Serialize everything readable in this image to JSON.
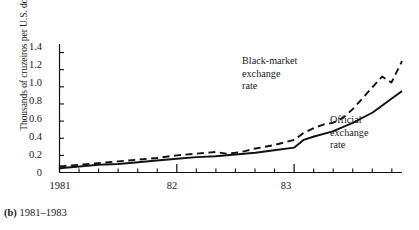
{
  "chart_data": {
    "type": "line",
    "title": "",
    "caption_prefix": "(b)",
    "caption_text": "1981–1983",
    "ylabel": "Thousands of cruzeiros per U.S. dollar",
    "xlabel": "",
    "ylim": [
      0,
      1.5
    ],
    "xlim": [
      1981.0,
      1983.92
    ],
    "grid": false,
    "legend_position": "inline-annotation",
    "yticks": [
      0,
      0.2,
      0.4,
      0.6,
      0.8,
      1.0,
      1.2,
      1.4
    ],
    "ytick_labels": [
      "0",
      "0.2",
      "0.4",
      "0.6",
      "0.8",
      "1.0",
      "1.2",
      "1.4"
    ],
    "xticks": [
      1981,
      1982,
      1983
    ],
    "xtick_labels": [
      "1981",
      "82",
      "83"
    ],
    "x_minor_tick_interval_months": 2,
    "series": [
      {
        "name": "Black-market exchange rate",
        "style": "dashed",
        "color": "#111111",
        "x": [
          1981.0,
          1981.17,
          1981.33,
          1981.5,
          1981.67,
          1981.83,
          1982.0,
          1982.17,
          1982.33,
          1982.42,
          1982.5,
          1982.58,
          1982.67,
          1982.83,
          1983.0,
          1983.08,
          1983.17,
          1983.25,
          1983.33,
          1983.42,
          1983.5,
          1983.58,
          1983.67,
          1983.75,
          1983.83,
          1983.92
        ],
        "values": [
          0.07,
          0.09,
          0.11,
          0.13,
          0.15,
          0.17,
          0.2,
          0.22,
          0.24,
          0.22,
          0.23,
          0.25,
          0.28,
          0.32,
          0.38,
          0.46,
          0.52,
          0.56,
          0.58,
          0.64,
          0.74,
          0.86,
          1.0,
          1.12,
          1.05,
          1.3
        ]
      },
      {
        "name": "Official exchange rate",
        "style": "solid",
        "color": "#111111",
        "x": [
          1981.0,
          1981.17,
          1981.33,
          1981.5,
          1981.67,
          1981.83,
          1982.0,
          1982.17,
          1982.33,
          1982.5,
          1982.67,
          1982.83,
          1983.0,
          1983.08,
          1983.17,
          1983.33,
          1983.5,
          1983.67,
          1983.83,
          1983.92
        ],
        "values": [
          0.05,
          0.07,
          0.09,
          0.1,
          0.12,
          0.14,
          0.16,
          0.18,
          0.19,
          0.21,
          0.23,
          0.26,
          0.29,
          0.38,
          0.42,
          0.48,
          0.58,
          0.7,
          0.86,
          0.95
        ]
      }
    ],
    "annotations": [
      {
        "id": "black-market",
        "text": "Black-market\nexchange\nrate",
        "target_series": "Black-market exchange rate"
      },
      {
        "id": "official",
        "text": "Official\nexchange\nrate",
        "target_series": "Official exchange rate"
      }
    ]
  }
}
